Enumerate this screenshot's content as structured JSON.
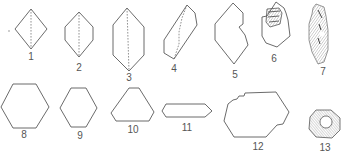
{
  "figure": {
    "labels": {
      "l1": "1",
      "l2": "2",
      "l3": "3",
      "l4": "4",
      "l5": "5",
      "l6": "6",
      "l7": "7",
      "l8": "8",
      "l9": "9",
      "l10": "10",
      "l11": "11",
      "l12": "12",
      "l13": "13"
    },
    "shapes": [
      {
        "id": 1,
        "kind": "rhombus",
        "dashed_axis": true
      },
      {
        "id": 2,
        "kind": "elongated hexagon",
        "dashed_axis": true
      },
      {
        "id": 3,
        "kind": "tall elongated hexagon",
        "dashed_axis": true
      },
      {
        "id": 4,
        "kind": "tilted elongated prism",
        "dashed_axis": true
      },
      {
        "id": 5,
        "kind": "irregular notched hexagon",
        "dashed_axis": false
      },
      {
        "id": 6,
        "kind": "irregular polygon with hatched inclusion",
        "dashed_axis": false
      },
      {
        "id": 7,
        "kind": "hatched elongated crystal",
        "dashed_axis": false
      },
      {
        "id": 8,
        "kind": "regular hexagon",
        "dashed_axis": false
      },
      {
        "id": 9,
        "kind": "small hexagon",
        "dashed_axis": false
      },
      {
        "id": 10,
        "kind": "truncated triangle",
        "dashed_axis": false
      },
      {
        "id": 11,
        "kind": "flat elongated hexagon",
        "dashed_axis": false
      },
      {
        "id": 12,
        "kind": "irregular stepped hexagon",
        "dashed_axis": false
      },
      {
        "id": 13,
        "kind": "hatched hexagonal ring",
        "dashed_axis": false
      }
    ],
    "colors": {
      "stroke": "#5a5a5a",
      "background": "#ffffff"
    }
  }
}
